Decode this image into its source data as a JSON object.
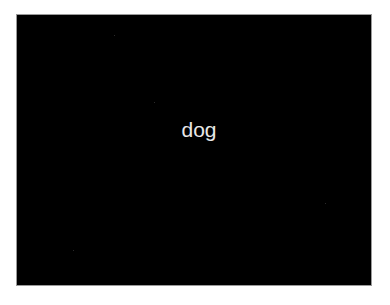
{
  "image": {
    "label": "dog",
    "background_color": "#000000",
    "text_color": "#e8e8e8",
    "frame_color": "#ffffff"
  }
}
